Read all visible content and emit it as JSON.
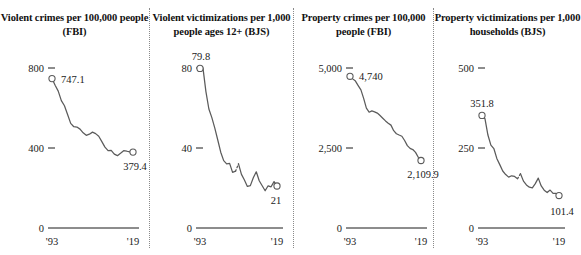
{
  "figure": {
    "background": "#ffffff",
    "line_color": "#5b5b5b",
    "marker_fill": "#ffffff",
    "marker_stroke": "#5b5b5b",
    "divider_color": "#8a8a8a"
  },
  "chart_data": [
    {
      "type": "line",
      "title": "Violent crimes per 100,000 people (FBI)",
      "xlabel": "",
      "ylabel": "",
      "grid": false,
      "legend": "none",
      "xlim": [
        1993,
        2019
      ],
      "ylim": [
        0,
        900
      ],
      "ytick_labels": [
        "800",
        "400",
        "0"
      ],
      "ytick_values": [
        800,
        400,
        0
      ],
      "xtick_labels": [
        "'93",
        "'19"
      ],
      "xtick_values": [
        1993,
        2019
      ],
      "start_label": "747.1",
      "end_label": "379.4",
      "x": [
        1993,
        1994,
        1995,
        1996,
        1997,
        1998,
        1999,
        2000,
        2001,
        2002,
        2003,
        2004,
        2005,
        2006,
        2007,
        2008,
        2009,
        2010,
        2011,
        2012,
        2013,
        2014,
        2015,
        2016,
        2017,
        2018,
        2019
      ],
      "values": [
        747.1,
        713.6,
        684.5,
        636.6,
        611.0,
        567.6,
        523.0,
        506.5,
        504.5,
        494.4,
        475.8,
        463.2,
        469.0,
        479.3,
        471.8,
        458.6,
        431.9,
        404.5,
        387.1,
        387.8,
        369.1,
        361.6,
        373.7,
        386.6,
        383.8,
        380.6,
        379.4
      ]
    },
    {
      "type": "line",
      "title": "Violent victimizations per 1,000 people ages 12+ (BJS)",
      "xlabel": "",
      "ylabel": "",
      "grid": false,
      "legend": "none",
      "xlim": [
        1993,
        2019
      ],
      "ylim": [
        0,
        90
      ],
      "ytick_labels": [
        "80",
        "40",
        "0"
      ],
      "ytick_values": [
        80,
        40,
        0
      ],
      "xtick_labels": [
        "'93",
        "'19"
      ],
      "xtick_values": [
        1993,
        2019
      ],
      "start_label": "79.8",
      "end_label": "21",
      "break_note": "dotted segment between 2005 and 2006 (survey redesign)",
      "x": [
        1993,
        1994,
        1995,
        1996,
        1997,
        1998,
        1999,
        2000,
        2001,
        2002,
        2003,
        2004,
        2005,
        2006,
        2007,
        2008,
        2009,
        2010,
        2011,
        2012,
        2013,
        2014,
        2015,
        2016,
        2017,
        2018,
        2019
      ],
      "values": [
        79.8,
        80.1,
        68.2,
        59.5,
        55.2,
        49.9,
        44.0,
        37.9,
        33.7,
        32.1,
        32.3,
        27.8,
        28.4,
        32.1,
        26.8,
        24.0,
        20.8,
        21.2,
        25.1,
        28.1,
        23.6,
        21.1,
        18.6,
        21.1,
        20.6,
        23.2,
        21.0
      ]
    },
    {
      "type": "line",
      "title": "Property crimes per 100,000 people (FBI)",
      "xlabel": "",
      "ylabel": "",
      "grid": false,
      "legend": "none",
      "xlim": [
        1993,
        2019
      ],
      "ylim": [
        0,
        5600
      ],
      "ytick_labels": [
        "5,000",
        "2,500",
        "0"
      ],
      "ytick_values": [
        5000,
        2500,
        0
      ],
      "xtick_labels": [
        "'93",
        "'19"
      ],
      "xtick_values": [
        1993,
        2019
      ],
      "start_label": "4,740",
      "end_label": "2,109.9",
      "x": [
        1993,
        1994,
        1995,
        1996,
        1997,
        1998,
        1999,
        2000,
        2001,
        2002,
        2003,
        2004,
        2005,
        2006,
        2007,
        2008,
        2009,
        2010,
        2011,
        2012,
        2013,
        2014,
        2015,
        2016,
        2017,
        2018,
        2019
      ],
      "values": [
        4740.0,
        4660.2,
        4590.5,
        4451.0,
        4316.3,
        4052.5,
        3743.6,
        3618.3,
        3658.1,
        3630.6,
        3591.2,
        3514.1,
        3431.5,
        3346.6,
        3276.4,
        3214.6,
        3041.3,
        2945.9,
        2905.4,
        2868.0,
        2733.6,
        2574.1,
        2487.0,
        2451.6,
        2362.2,
        2209.8,
        2109.9
      ]
    },
    {
      "type": "line",
      "title": "Property victimizations per 1,000 households (BJS)",
      "xlabel": "",
      "ylabel": "",
      "grid": false,
      "legend": "none",
      "xlim": [
        1993,
        2019
      ],
      "ylim": [
        0,
        560
      ],
      "ytick_labels": [
        "500",
        "250",
        "0"
      ],
      "ytick_values": [
        500,
        250,
        0
      ],
      "xtick_labels": [
        "'93",
        "'19"
      ],
      "xtick_values": [
        1993,
        2019
      ],
      "start_label": "351.8",
      "end_label": "101.4",
      "break_note": "dotted segment between 2005 and 2006 (survey redesign)",
      "x": [
        1993,
        1994,
        1995,
        1996,
        1997,
        1998,
        1999,
        2000,
        2001,
        2002,
        2003,
        2004,
        2005,
        2006,
        2007,
        2008,
        2009,
        2010,
        2011,
        2012,
        2013,
        2014,
        2015,
        2016,
        2017,
        2018,
        2019
      ],
      "values": [
        351.8,
        341.5,
        290.5,
        259.0,
        248.3,
        217.4,
        198.0,
        178.1,
        166.9,
        159.0,
        163.2,
        161.1,
        154.1,
        169.7,
        146.5,
        134.7,
        127.4,
        125.4,
        138.7,
        155.8,
        131.4,
        118.1,
        110.7,
        118.6,
        108.4,
        108.2,
        101.4
      ]
    }
  ]
}
